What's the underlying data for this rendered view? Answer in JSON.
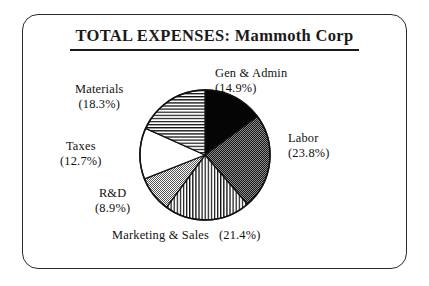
{
  "figure": {
    "title": "TOTAL EXPENSES:  Mammoth Corp",
    "border_color": "#2b2b2b",
    "background": "#ffffff"
  },
  "chart_data": {
    "type": "pie",
    "title": "TOTAL EXPENSES:  Mammoth Corp",
    "xlabel": "",
    "ylabel": "",
    "units": "percent",
    "start_angle_oclock": 12,
    "direction": "clockwise",
    "legend": "none",
    "grid": false,
    "categories": [
      "Gen & Admin",
      "Labor",
      "Marketing & Sales",
      "R&D",
      "Taxes",
      "Materials"
    ],
    "values": [
      14.9,
      23.8,
      21.4,
      8.9,
      12.7,
      18.3
    ],
    "slices": [
      {
        "name": "Gen & Admin",
        "value": 14.9,
        "label_name": "Gen & Admin",
        "label_pct": "(14.9%)",
        "fill": "solid-black",
        "fill_color": "#050505"
      },
      {
        "name": "Labor",
        "value": 23.8,
        "label_name": "Labor",
        "label_pct": "(23.8%)",
        "fill": "dark-stipple",
        "fill_color": "#3a3a3a"
      },
      {
        "name": "Marketing & Sales",
        "value": 21.4,
        "label_name": "Marketing & Sales",
        "label_pct": "(21.4%)",
        "fill": "vertical-lines",
        "fill_color": "#ffffff"
      },
      {
        "name": "R&D",
        "value": 8.9,
        "label_name": "R&D",
        "label_pct": "(8.9%)",
        "fill": "light-stipple",
        "fill_color": "#c9c9c9"
      },
      {
        "name": "Taxes",
        "value": 12.7,
        "label_name": "Taxes",
        "label_pct": "(12.7%)",
        "fill": "white",
        "fill_color": "#ffffff"
      },
      {
        "name": "Materials",
        "value": 18.3,
        "label_name": "Materials",
        "label_pct": "(18.3%)",
        "fill": "horizontal-lines",
        "fill_color": "#ffffff"
      }
    ]
  }
}
